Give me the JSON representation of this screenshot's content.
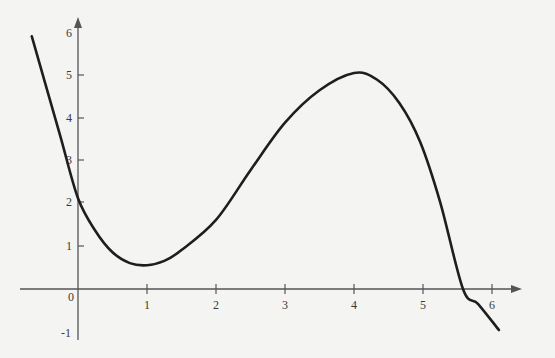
{
  "chart_data": {
    "type": "line",
    "title": "",
    "xlabel": "",
    "ylabel": "",
    "xlim": [
      -0.8,
      6.5
    ],
    "ylim": [
      -1.2,
      6.4
    ],
    "grid": false,
    "legend": null,
    "x_ticks": [
      "1",
      "2",
      "3",
      "4",
      "5",
      "6"
    ],
    "y_ticks": [
      "-1",
      "1",
      "2",
      "3",
      "4",
      "5",
      "6"
    ],
    "origin_label": "0",
    "series": [
      {
        "name": "f(x)",
        "x": [
          -0.67,
          -0.5,
          -0.25,
          0,
          0.25,
          0.5,
          0.75,
          1.0,
          1.25,
          1.5,
          2.0,
          2.5,
          3.0,
          3.5,
          4.0,
          4.33,
          4.66,
          4.96,
          5.25,
          5.58,
          5.8,
          6.1
        ],
        "y": [
          5.85,
          4.9,
          3.5,
          2.1,
          1.35,
          0.85,
          0.6,
          0.55,
          0.65,
          0.9,
          1.6,
          2.75,
          3.85,
          4.6,
          5.0,
          4.85,
          4.3,
          3.4,
          2.0,
          0.0,
          -0.35,
          -0.95
        ]
      }
    ],
    "annotations": {
      "local_min": {
        "x": 1,
        "y": 0.55
      },
      "local_max": {
        "x": 4,
        "y": 5.0
      },
      "x_intercept": 5.58,
      "y_intercept": 2.1
    }
  },
  "axes": {
    "origin_px": [
      78,
      289
    ],
    "px_per_unit_x": 69,
    "px_per_unit_y": 43.2,
    "axis_color": "#555555",
    "curve_color": "#1e1e1e"
  },
  "labels": {
    "origin": "0",
    "x": [
      "1",
      "2",
      "3",
      "4",
      "5",
      "6"
    ],
    "y": [
      "-1",
      "1",
      "2",
      "3",
      "4",
      "5",
      "6"
    ]
  }
}
